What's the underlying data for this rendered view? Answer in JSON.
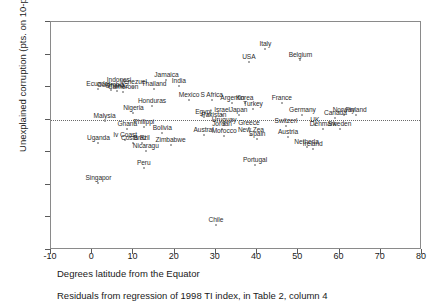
{
  "chart_data": {
    "type": "scatter",
    "title": "",
    "xlabel": "Degrees latitude from the Equator",
    "ylabel": "Unexplained corruption (pts. on 10-pt. scale)",
    "caption": "Residuals from regression of 1998 TI index, in Table 2, column 4",
    "xlim": [
      -10,
      80
    ],
    "ylim": [
      -4,
      3
    ],
    "xticks": [
      -10,
      0,
      10,
      20,
      30,
      40,
      50,
      60,
      70,
      80
    ],
    "yticks": [
      3,
      2,
      1,
      0,
      -1,
      -2,
      -3,
      -4
    ],
    "grid": false,
    "legend": null,
    "zero_reference_line": 0,
    "marker_color": "#8d8d8d",
    "points": [
      {
        "label": "Italy",
        "x": 42.0,
        "y": 2.17
      },
      {
        "label": "USA",
        "x": 38.0,
        "y": 1.78
      },
      {
        "label": "Belgium",
        "x": 50.5,
        "y": 1.82
      },
      {
        "label": "Jamaica",
        "x": 18.0,
        "y": 1.22
      },
      {
        "label": "India",
        "x": 21.0,
        "y": 1.03
      },
      {
        "label": "Indonesi",
        "x": 6.5,
        "y": 1.07
      },
      {
        "label": "Venezuel",
        "x": 10.0,
        "y": 1.0
      },
      {
        "label": "Ecuador",
        "x": 1.5,
        "y": 0.93
      },
      {
        "label": "Colombia",
        "x": 4.5,
        "y": 0.9
      },
      {
        "label": "Ghana2",
        "x": 6.0,
        "y": 0.88
      },
      {
        "label": "Cameroon",
        "x": 7.5,
        "y": 0.86
      },
      {
        "label": "Thailand",
        "x": 15.0,
        "y": 0.95
      },
      {
        "label": "Mexico",
        "x": 23.5,
        "y": 0.62
      },
      {
        "label": "S Africa",
        "x": 29.0,
        "y": 0.62
      },
      {
        "label": "Argentin",
        "x": 34.0,
        "y": 0.52
      },
      {
        "label": "Korea",
        "x": 37.0,
        "y": 0.52
      },
      {
        "label": "France",
        "x": 46.0,
        "y": 0.5
      },
      {
        "label": "Turkey",
        "x": 39.0,
        "y": 0.33
      },
      {
        "label": "Honduras",
        "x": 14.5,
        "y": 0.43
      },
      {
        "label": "Nigeria",
        "x": 10.0,
        "y": 0.22
      },
      {
        "label": "Egypt",
        "x": 27.0,
        "y": 0.07
      },
      {
        "label": "Israel",
        "x": 31.5,
        "y": 0.14
      },
      {
        "label": "Japan",
        "x": 35.5,
        "y": 0.14
      },
      {
        "label": "Germany",
        "x": 51.0,
        "y": 0.13
      },
      {
        "label": "Norway",
        "x": 61.0,
        "y": 0.16
      },
      {
        "label": "Finland",
        "x": 64.0,
        "y": 0.15
      },
      {
        "label": "Canada",
        "x": 59.0,
        "y": 0.05
      },
      {
        "label": "Pakistan",
        "x": 29.5,
        "y": -0.02
      },
      {
        "label": "Malysia",
        "x": 3.0,
        "y": -0.03
      },
      {
        "label": "Philippi",
        "x": 12.5,
        "y": -0.22
      },
      {
        "label": "Ghana",
        "x": 8.5,
        "y": -0.27
      },
      {
        "label": "Uruguay",
        "x": 32.0,
        "y": -0.15
      },
      {
        "label": "Switzerl",
        "x": 47.0,
        "y": -0.18
      },
      {
        "label": "UK",
        "x": 54.0,
        "y": -0.15
      },
      {
        "label": "Greece",
        "x": 38.0,
        "y": -0.25
      },
      {
        "label": "Jordan",
        "x": 31.5,
        "y": -0.3
      },
      {
        "label": "Denmark",
        "x": 56.0,
        "y": -0.28
      },
      {
        "label": "Sweden",
        "x": 60.0,
        "y": -0.3
      },
      {
        "label": "Bolivia",
        "x": 17.0,
        "y": -0.4
      },
      {
        "label": "Austral",
        "x": 27.0,
        "y": -0.48
      },
      {
        "label": "Morocco",
        "x": 32.0,
        "y": -0.5
      },
      {
        "label": "New Zea",
        "x": 38.5,
        "y": -0.48
      },
      {
        "label": "Austria",
        "x": 47.5,
        "y": -0.52
      },
      {
        "label": "Spain",
        "x": 40.0,
        "y": -0.6
      },
      {
        "label": "Iv Coast",
        "x": 8.0,
        "y": -0.62
      },
      {
        "label": "Costa Ri",
        "x": 10.0,
        "y": -0.72
      },
      {
        "label": "Brazil",
        "x": 12.0,
        "y": -0.72
      },
      {
        "label": "Uganda",
        "x": 1.5,
        "y": -0.72
      },
      {
        "label": "Zimbabwe",
        "x": 19.0,
        "y": -0.78
      },
      {
        "label": "Netherla",
        "x": 52.0,
        "y": -0.83
      },
      {
        "label": "Ireland",
        "x": 53.5,
        "y": -0.9
      },
      {
        "label": "Nicaragu",
        "x": 13.0,
        "y": -0.95
      },
      {
        "label": "Peru",
        "x": 12.5,
        "y": -1.48
      },
      {
        "label": "Portugal",
        "x": 39.5,
        "y": -1.38
      },
      {
        "label": "Singapor",
        "x": 1.5,
        "y": -1.95
      },
      {
        "label": "Chile",
        "x": 30.0,
        "y": -3.22
      }
    ]
  }
}
